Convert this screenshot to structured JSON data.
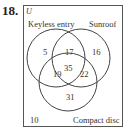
{
  "problem_number": "18.",
  "universe_label": "U",
  "sets": {
    "a": {
      "label": "Keyless entry"
    },
    "b": {
      "label": "Sunroof"
    },
    "c": {
      "label": "Compact disc"
    }
  },
  "regions": {
    "a_only": "5",
    "ab_only": "17",
    "b_only": "16",
    "ac_only": "19",
    "abc": "35",
    "bc_only": "22",
    "c_only": "31",
    "outside": "10"
  }
}
